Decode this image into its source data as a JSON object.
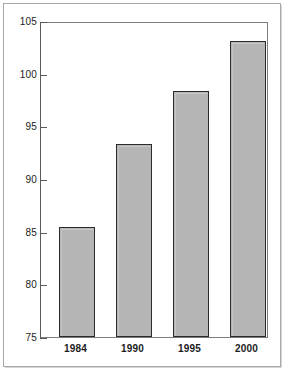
{
  "chart_data": {
    "type": "bar",
    "title": "",
    "subtitle": "",
    "xlabel": "",
    "ylabel": "",
    "categories": [
      "1984",
      "1990",
      "1995",
      "2000"
    ],
    "values": [
      85.5,
      93.4,
      98.5,
      103.3
    ],
    "ylim": [
      75,
      105
    ],
    "yticks": [
      75,
      80,
      85,
      90,
      95,
      100,
      105
    ],
    "ytick_labels": [
      "75",
      "80",
      "85",
      "90",
      "95",
      "100",
      "105"
    ],
    "grid": false,
    "legend": null,
    "annotations": [],
    "series": [
      {
        "name": "",
        "values": [
          85.5,
          93.4,
          98.5,
          103.3
        ]
      }
    ]
  },
  "style": {
    "bar_fill": "#b5b5b5",
    "bar_edge": "#2b2b2b",
    "axis_color": "#5a5a5a",
    "plot_border": "#7d7d7d",
    "frame_border": "#a9a9a9",
    "text_color": "#1c1c1c",
    "background": "#ffffff"
  },
  "axis": {
    "y_tick_0": "75",
    "y_tick_1": "80",
    "y_tick_2": "85",
    "y_tick_3": "90",
    "y_tick_4": "95",
    "y_tick_5": "100",
    "y_tick_6": "105",
    "x_tick_0": "1984",
    "x_tick_1": "1990",
    "x_tick_2": "1995",
    "x_tick_3": "2000"
  }
}
